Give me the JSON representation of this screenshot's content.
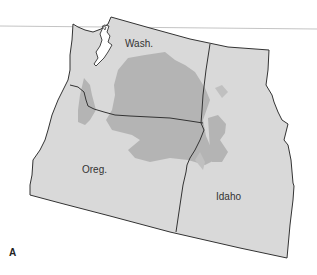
{
  "figure": {
    "panel_label": "A",
    "regions": [
      {
        "name": "Wash.",
        "label": "Wash."
      },
      {
        "name": "Oreg.",
        "label": "Oreg."
      },
      {
        "name": "Idaho",
        "label": "Idaho"
      }
    ],
    "colors": {
      "state_fill": "#d9d9d9",
      "highlight_fill": "#b4b4b4",
      "border": "#333333",
      "rule_line": "#bdbdbd"
    }
  }
}
